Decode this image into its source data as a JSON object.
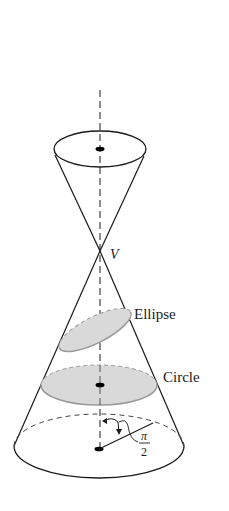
{
  "figure": {
    "labels": {
      "vertex": "V",
      "ellipse": "Ellipse",
      "circle": "Circle",
      "angle_numerator": "π",
      "angle_denominator": "2"
    },
    "colors": {
      "stroke": "#1a1a1a",
      "section_fill": "#d9d9d9",
      "section_stroke": "#9a9a9a",
      "background": "#ffffff"
    }
  }
}
